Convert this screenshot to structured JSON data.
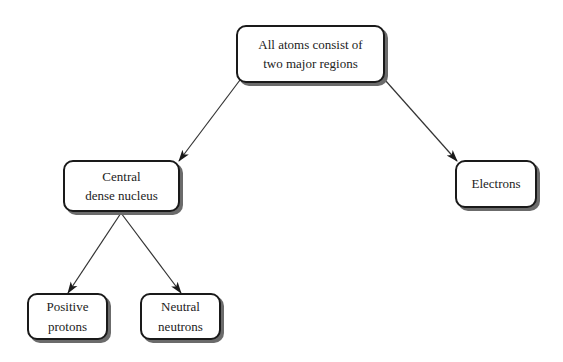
{
  "diagram": {
    "type": "concept-map",
    "nodes": {
      "root": {
        "label": "All atoms consist of\ntwo major regions"
      },
      "nucleus": {
        "label": "Central\ndense nucleus"
      },
      "electrons": {
        "label": "Electrons"
      },
      "protons": {
        "label": "Positive\nprotons"
      },
      "neutrons": {
        "label": "Neutral\nneutrons"
      }
    },
    "edges": [
      {
        "from": "root",
        "to": "nucleus"
      },
      {
        "from": "root",
        "to": "electrons"
      },
      {
        "from": "nucleus",
        "to": "protons"
      },
      {
        "from": "nucleus",
        "to": "neutrons"
      }
    ]
  }
}
